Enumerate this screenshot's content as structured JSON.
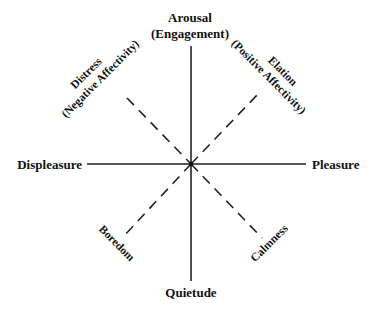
{
  "diagram": {
    "type": "circumplex",
    "axes": {
      "vertical_top": {
        "line1": "Arousal",
        "line2": "(Engagement)"
      },
      "vertical_bottom": {
        "label": "Quietude"
      },
      "horizontal_left": {
        "label": "Displeasure"
      },
      "horizontal_right": {
        "label": "Pleasure"
      }
    },
    "diagonals": {
      "upper_left": {
        "line1": "Distress",
        "line2": "(Negative Affectivity)"
      },
      "upper_right": {
        "line1": "Elation",
        "line2": "(Positive Affectivity)"
      },
      "lower_left": {
        "label": "Boredom"
      },
      "lower_right": {
        "label": "Calmness"
      }
    },
    "colors": {
      "line": "#222222",
      "text": "#111111",
      "background": "#ffffff"
    }
  }
}
